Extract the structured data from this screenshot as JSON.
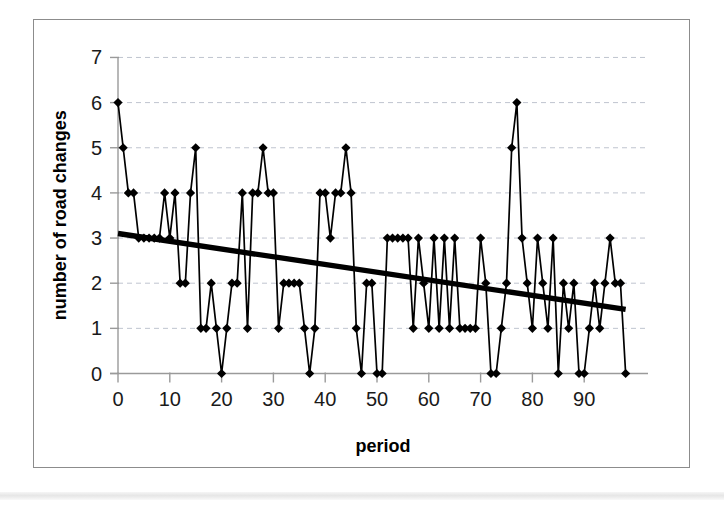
{
  "figure": {
    "frame_color": "#8c8c8c",
    "background": "#ffffff"
  },
  "chart_data": {
    "type": "line",
    "title": "",
    "xlabel": "period",
    "ylabel": "number of road changes",
    "xlim": [
      0,
      99
    ],
    "ylim": [
      0,
      7
    ],
    "x_ticks": [
      0,
      10,
      20,
      30,
      40,
      50,
      60,
      70,
      80,
      90
    ],
    "y_ticks": [
      0,
      1,
      2,
      3,
      4,
      5,
      6,
      7
    ],
    "grid": "horizontal-dashed",
    "legend": "none",
    "marker": "diamond",
    "series_color": "#000000",
    "trend_color": "#000000",
    "x": [
      0,
      1,
      2,
      3,
      4,
      5,
      6,
      7,
      8,
      9,
      10,
      11,
      12,
      13,
      14,
      15,
      16,
      17,
      18,
      19,
      20,
      21,
      22,
      23,
      24,
      25,
      26,
      27,
      28,
      29,
      30,
      31,
      32,
      33,
      34,
      35,
      36,
      37,
      38,
      39,
      40,
      41,
      42,
      43,
      44,
      45,
      46,
      47,
      48,
      49,
      50,
      51,
      52,
      53,
      54,
      55,
      56,
      57,
      58,
      59,
      60,
      61,
      62,
      63,
      64,
      65,
      66,
      67,
      68,
      69,
      70,
      71,
      72,
      73,
      74,
      75,
      76,
      77,
      78,
      79,
      80,
      81,
      82,
      83,
      84,
      85,
      86,
      87,
      88,
      89,
      90,
      91,
      92,
      93,
      94,
      95,
      96,
      97,
      98
    ],
    "values": [
      6,
      5,
      4,
      4,
      3,
      3,
      3,
      3,
      3,
      4,
      3,
      4,
      2,
      2,
      4,
      5,
      1,
      1,
      2,
      1,
      0,
      1,
      2,
      2,
      4,
      1,
      4,
      4,
      5,
      4,
      4,
      1,
      2,
      2,
      2,
      2,
      1,
      0,
      1,
      4,
      4,
      3,
      4,
      4,
      5,
      4,
      1,
      0,
      2,
      2,
      0,
      0,
      3,
      3,
      3,
      3,
      3,
      1,
      3,
      2,
      1,
      3,
      1,
      3,
      1,
      3,
      1,
      1,
      1,
      1,
      3,
      2,
      0,
      0,
      1,
      2,
      5,
      6,
      3,
      2,
      1,
      3,
      2,
      1,
      3,
      0,
      2,
      1,
      2,
      0,
      0,
      1,
      2,
      1,
      2,
      3,
      2,
      2,
      0
    ],
    "trendline": {
      "type": "linear",
      "x_start": 0,
      "y_start": 3.1,
      "x_end": 98,
      "y_end": 1.42
    }
  }
}
